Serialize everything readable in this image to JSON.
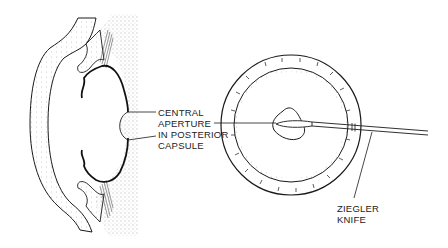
{
  "diagram": {
    "labels": {
      "aperture": [
        "CENTRAL",
        "APERTURE",
        "IN POSTERIOR",
        "CAPSULE"
      ],
      "knife": [
        "ZIEGLER",
        "KNIFE"
      ]
    },
    "colors": {
      "ink": "#1a1a1a",
      "stipple": "#555555",
      "background": "#ffffff"
    }
  }
}
